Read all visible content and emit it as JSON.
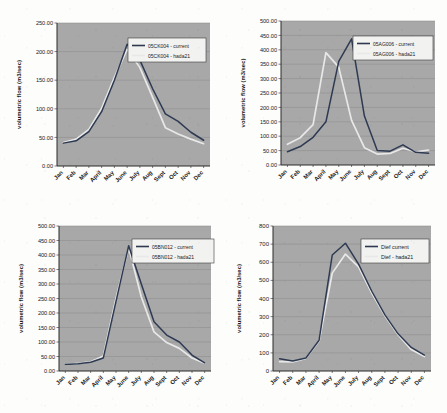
{
  "figure": {
    "background_color": "#fdfdfb",
    "plot_background_color": "#a8a8a8",
    "gridline_color": "#8e8e8e",
    "axis_color": "#2a2a2a",
    "series_colors": {
      "current": "#2d3a52",
      "hada21": "#e8e8e8"
    },
    "layout": "2x2 grid of line charts"
  },
  "chart_data": [
    {
      "type": "line",
      "title": "",
      "xlabel": "",
      "ylabel": "volumetric flow (m3/sec)",
      "categories": [
        "Jan",
        "Feb",
        "Mar",
        "April",
        "May",
        "June",
        "July",
        "Aug",
        "Sept",
        "Oct",
        "Nov",
        "Dec"
      ],
      "ylim": [
        0,
        250
      ],
      "ytick_values": [
        0,
        50,
        100,
        150,
        200,
        250
      ],
      "ytick_labels": [
        "0.00",
        "50.00",
        "100.00",
        "150.00",
        "200.00",
        "250.00"
      ],
      "grid": true,
      "legend_position": "upper-right-inside",
      "series": [
        {
          "name": "05CK004 - current",
          "color": "#2d3a52",
          "values": [
            40,
            44,
            60,
            95,
            150,
            213,
            185,
            135,
            91,
            78,
            59,
            45
          ]
        },
        {
          "name": "05CK004 - hada21",
          "color": "#e8e8e8",
          "values": [
            41,
            47,
            64,
            101,
            155,
            204,
            172,
            120,
            67,
            56,
            47,
            39
          ]
        }
      ]
    },
    {
      "type": "line",
      "title": "",
      "xlabel": "",
      "ylabel": "volumetric flow (m3/sec)",
      "categories": [
        "Jan",
        "Feb",
        "Mar",
        "April",
        "May",
        "June",
        "July",
        "Aug",
        "Sept",
        "Oct",
        "Nov",
        "Dec"
      ],
      "ylim": [
        0,
        500
      ],
      "ytick_values": [
        0,
        50,
        100,
        150,
        200,
        250,
        300,
        350,
        400,
        450,
        500
      ],
      "ytick_labels": [
        "0.00",
        "50.00",
        "100.00",
        "150.00",
        "200.00",
        "250.00",
        "300.00",
        "350.00",
        "400.00",
        "450.00",
        "500.00"
      ],
      "grid": true,
      "legend_position": "upper-right-inside",
      "series": [
        {
          "name": "05AG006 - current",
          "color": "#2d3a52",
          "values": [
            46,
            64,
            96,
            150,
            360,
            438,
            170,
            50,
            48,
            70,
            44,
            41
          ]
        },
        {
          "name": "05AG006 - hada21",
          "color": "#e8e8e8",
          "values": [
            72,
            95,
            140,
            390,
            340,
            155,
            60,
            38,
            40,
            58,
            46,
            52
          ]
        }
      ]
    },
    {
      "type": "line",
      "title": "",
      "xlabel": "",
      "ylabel": "volumetric flow (m3/sec)",
      "categories": [
        "Jan",
        "Feb",
        "Mar",
        "April",
        "May",
        "June",
        "July",
        "Aug",
        "Sept",
        "Oct",
        "Nov",
        "Dec"
      ],
      "ylim": [
        0,
        500
      ],
      "ytick_values": [
        0,
        50,
        100,
        150,
        200,
        250,
        300,
        350,
        400,
        450,
        500
      ],
      "ytick_labels": [
        "0.00",
        "50.00",
        "100.00",
        "150.00",
        "200.00",
        "250.00",
        "300.00",
        "350.00",
        "400.00",
        "450.00",
        "500.00"
      ],
      "grid": true,
      "legend_position": "upper-right-inside",
      "series": [
        {
          "name": "05BN012 - current",
          "color": "#2d3a52",
          "values": [
            22,
            25,
            30,
            45,
            240,
            432,
            300,
            170,
            124,
            100,
            55,
            28
          ]
        },
        {
          "name": "05BN012 - hada21",
          "color": "#e8e8e8",
          "values": [
            22,
            26,
            32,
            52,
            250,
            425,
            255,
            135,
            98,
            78,
            45,
            27
          ]
        }
      ]
    },
    {
      "type": "line",
      "title": "",
      "xlabel": "",
      "ylabel": "volumetric flow (m3/sec)",
      "categories": [
        "Jan",
        "Feb",
        "Mar",
        "April",
        "May",
        "June",
        "July",
        "Aug",
        "Sept",
        "Oct",
        "Nov",
        "Dec"
      ],
      "ylim": [
        0,
        800
      ],
      "ytick_values": [
        0,
        100,
        200,
        300,
        400,
        500,
        600,
        700,
        800
      ],
      "ytick_labels": [
        "0",
        "100",
        "200",
        "300",
        "400",
        "500",
        "600",
        "700",
        "800"
      ],
      "grid": true,
      "legend_position": "upper-right-inside",
      "series": [
        {
          "name": "Dief current",
          "color": "#2d3a52",
          "values": [
            68,
            55,
            72,
            170,
            640,
            705,
            590,
            440,
            310,
            205,
            130,
            88
          ]
        },
        {
          "name": "Dief - hada21",
          "color": "#e8e8e8",
          "values": [
            52,
            50,
            70,
            165,
            540,
            645,
            575,
            430,
            305,
            200,
            118,
            80
          ]
        }
      ]
    }
  ]
}
